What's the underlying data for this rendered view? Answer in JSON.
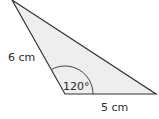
{
  "diagram": {
    "type": "triangle",
    "vertices": {
      "top": [
        12,
        0
      ],
      "bottom_left": [
        65,
        94
      ],
      "bottom_right": [
        156,
        94
      ]
    },
    "fill_color": "#eeeeee",
    "stroke_color": "#333333",
    "labels": {
      "left_side": "6 cm",
      "bottom_side": "5 cm",
      "angle": "120°"
    },
    "angle_marker": {
      "vertex": "bottom_left",
      "degrees": 120,
      "radius": 28
    }
  }
}
